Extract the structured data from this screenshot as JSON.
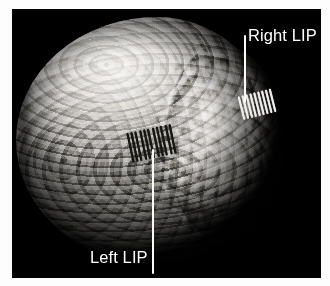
{
  "figure": {
    "kind": "brain-surface-rendering",
    "panel_background": "#000000",
    "page_background": "#ffffff",
    "panel": {
      "x": 12,
      "y": 9,
      "width": 309,
      "height": 269
    }
  },
  "annotations": [
    {
      "name": "right-lip",
      "label": "Right LIP",
      "text_color": "#ffffff",
      "leader_color": "#fbfbfb",
      "leader": {
        "x": 232,
        "y": 26,
        "length": 68,
        "orientation": "vertical"
      },
      "label_position": {
        "x": 236,
        "y": 18
      },
      "marker": {
        "style": "hatch-cluster",
        "color": "#efeeea",
        "stripes": 9,
        "x": 228,
        "y": 83,
        "width": 36,
        "height": 24,
        "rotation_deg": -14
      }
    },
    {
      "name": "left-lip",
      "label": "Left LIP",
      "text_color": "#ffffff",
      "leader_color": "#fbfbfb",
      "leader": {
        "x": 140,
        "y": 140,
        "length": 125,
        "orientation": "vertical"
      },
      "label_position": {
        "x": 78,
        "y": 240
      },
      "marker": {
        "style": "hatch-cluster",
        "color": "#16150f",
        "stripes": 11,
        "x": 117,
        "y": 119,
        "width": 48,
        "height": 30,
        "rotation_deg": -12
      }
    }
  ],
  "brain": {
    "view": "left-posterior-oblique three-quarter view of cortical surface",
    "render": "grayscale volumetric surface with gyri and sulci",
    "highlight_color": "#e9e7e4",
    "midtone_color": "#a7a4a0",
    "shadow_color": "#3d3b39",
    "bounds": {
      "x": 4,
      "y": 2,
      "width": 268,
      "height": 255
    }
  }
}
